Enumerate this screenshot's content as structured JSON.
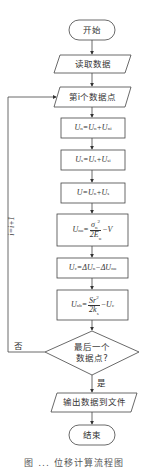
{
  "flowchart": {
    "start": "开始",
    "read_data": "读取数据",
    "point_i": "第i个数据点",
    "step1": "Un=Un+U'n",
    "step2": "Us=Us+U's",
    "step3": "U=Un+Us",
    "step4": "Un^u = σn² / (2Eu) − V",
    "step5": "Uc=ΔUn−ΔUn^u",
    "step6": "Un^b = Sr² / (2ks) − Uc",
    "decision": [
      "最后一个",
      "数据点?"
    ],
    "yes_label": "是",
    "no_label": "否",
    "loop_label": "i=i+1",
    "output": "输出数据到文件",
    "end": "结束"
  },
  "formula_parts": {
    "s1": {
      "lhs": "U",
      "lhs_sub": "n",
      "rhs1": "U",
      "rhs1_sub": "n",
      "rhs2": "U",
      "rhs2_sub": "n",
      "rhs2_sup": "i"
    },
    "s2": {
      "lhs": "U",
      "lhs_sub": "s",
      "rhs1": "U",
      "rhs1_sub": "s",
      "rhs2": "U",
      "rhs2_sub": "s",
      "rhs2_sup": "i"
    },
    "s3": {
      "lhs": "U",
      "rhs1": "U",
      "rhs1_sub": "n",
      "rhs2": "U",
      "rhs2_sub": "s"
    },
    "s4": {
      "lhs": "U",
      "lhs_sub": "n",
      "lhs_sup": "u",
      "num": "σ",
      "num_sub": "n",
      "num_sup": "2",
      "den": "2E",
      "den_sub": "u",
      "tail": "V"
    },
    "s5": {
      "lhs": "U",
      "lhs_sub": "c",
      "a": "ΔU",
      "a_sub": "n",
      "b": "ΔU",
      "b_sub": "n",
      "b_sup": "u"
    },
    "s6": {
      "lhs": "U",
      "lhs_sub": "n",
      "lhs_sup": "b",
      "num": "Sr",
      "num_sup": "2",
      "den": "2k",
      "den_sub": "s",
      "tail": "U",
      "tail_sub": "c"
    }
  },
  "ops": {
    "eq": "=",
    "plus": "+",
    "minus": "−"
  },
  "caption": "图 ... 位移计算流程图"
}
